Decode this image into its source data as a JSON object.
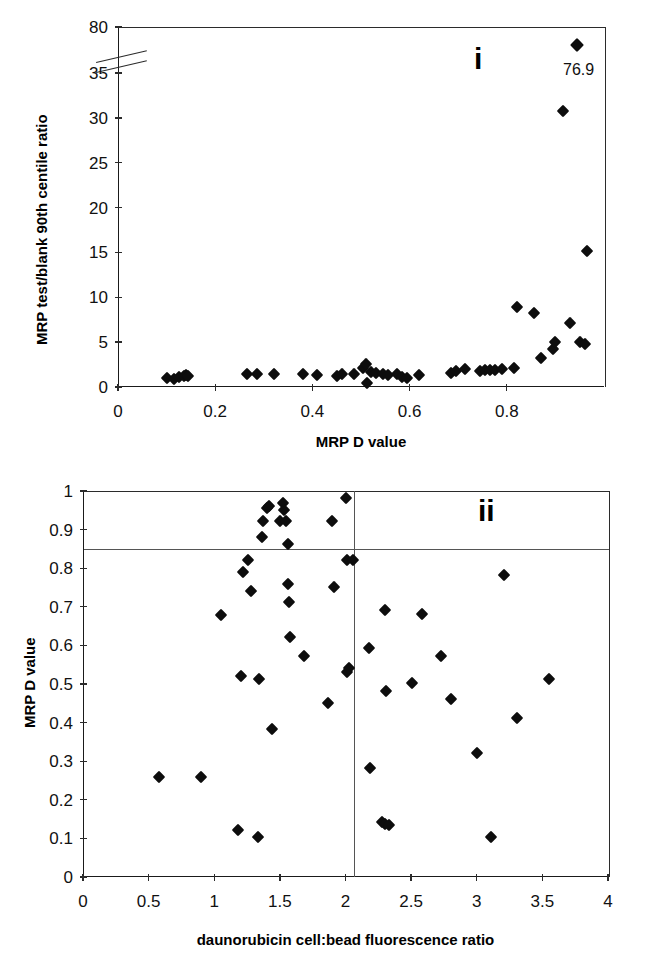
{
  "figure": {
    "background": "#ffffff",
    "marker_color": "#0d0d0d",
    "axis_color": "#2b2b2b",
    "refline_color": "#555555"
  },
  "chart_data": [
    {
      "type": "scatter",
      "panel_label": "i",
      "title": "",
      "xlabel": "MRP D value",
      "ylabel": "MRP test/blank 90th centile ratio",
      "xlim": [
        0,
        1.0
      ],
      "ylim": [
        0,
        40
      ],
      "grid": false,
      "legend": "none",
      "axis_break": {
        "present": true,
        "between": [
          36,
          79
        ],
        "note": "y-axis broken between 35 and 80"
      },
      "xticks": [
        0,
        0.2,
        0.4,
        0.6,
        0.8
      ],
      "xtick_labels": [
        "0",
        "0.2",
        "0.4",
        "0.6",
        "0.8"
      ],
      "yticks": [
        0,
        5,
        10,
        15,
        20,
        25,
        30,
        35,
        80
      ],
      "ytick_labels": [
        "0",
        "5",
        "10",
        "15",
        "20",
        "25",
        "30",
        "35",
        "80"
      ],
      "annotations": [
        {
          "text": "76.9",
          "x": 0.945,
          "y": 36.0,
          "note": "off-scale value label for topmost point"
        }
      ],
      "points": [
        {
          "x": 0.1,
          "y": 1.0
        },
        {
          "x": 0.115,
          "y": 0.9
        },
        {
          "x": 0.125,
          "y": 1.1
        },
        {
          "x": 0.135,
          "y": 1.2
        },
        {
          "x": 0.14,
          "y": 1.3
        },
        {
          "x": 0.145,
          "y": 1.2
        },
        {
          "x": 0.265,
          "y": 1.4
        },
        {
          "x": 0.285,
          "y": 1.4
        },
        {
          "x": 0.32,
          "y": 1.4
        },
        {
          "x": 0.38,
          "y": 1.5
        },
        {
          "x": 0.41,
          "y": 1.3
        },
        {
          "x": 0.45,
          "y": 1.2
        },
        {
          "x": 0.46,
          "y": 1.5
        },
        {
          "x": 0.485,
          "y": 1.4
        },
        {
          "x": 0.505,
          "y": 2.1
        },
        {
          "x": 0.51,
          "y": 2.6
        },
        {
          "x": 0.512,
          "y": 0.4
        },
        {
          "x": 0.52,
          "y": 1.7
        },
        {
          "x": 0.53,
          "y": 1.6
        },
        {
          "x": 0.545,
          "y": 1.4
        },
        {
          "x": 0.555,
          "y": 1.3
        },
        {
          "x": 0.575,
          "y": 1.4
        },
        {
          "x": 0.585,
          "y": 1.1
        },
        {
          "x": 0.595,
          "y": 1.0
        },
        {
          "x": 0.62,
          "y": 1.3
        },
        {
          "x": 0.685,
          "y": 1.6
        },
        {
          "x": 0.695,
          "y": 1.8
        },
        {
          "x": 0.715,
          "y": 2.0
        },
        {
          "x": 0.745,
          "y": 1.8
        },
        {
          "x": 0.755,
          "y": 1.9
        },
        {
          "x": 0.765,
          "y": 1.9
        },
        {
          "x": 0.775,
          "y": 1.9
        },
        {
          "x": 0.79,
          "y": 2.0
        },
        {
          "x": 0.815,
          "y": 2.1
        },
        {
          "x": 0.82,
          "y": 8.9
        },
        {
          "x": 0.855,
          "y": 8.3
        },
        {
          "x": 0.87,
          "y": 3.2
        },
        {
          "x": 0.895,
          "y": 4.2
        },
        {
          "x": 0.9,
          "y": 5.0
        },
        {
          "x": 0.915,
          "y": 30.8
        },
        {
          "x": 0.93,
          "y": 7.1
        },
        {
          "x": 0.945,
          "y": 76.9
        },
        {
          "x": 0.95,
          "y": 5.0
        },
        {
          "x": 0.96,
          "y": 4.8
        },
        {
          "x": 0.965,
          "y": 15.2
        }
      ]
    },
    {
      "type": "scatter",
      "panel_label": "ii",
      "title": "",
      "xlabel": "daunorubicin cell:bead fluorescence ratio",
      "ylabel": "MRP D value",
      "xlim": [
        0,
        4
      ],
      "ylim": [
        0,
        1
      ],
      "grid": false,
      "legend": "none",
      "xticks": [
        0,
        0.5,
        1,
        1.5,
        2,
        2.5,
        3,
        3.5,
        4
      ],
      "xtick_labels": [
        "0",
        "0.5",
        "1",
        "1.5",
        "2",
        "2.5",
        "3",
        "3.5",
        "4"
      ],
      "yticks": [
        0,
        0.1,
        0.2,
        0.3,
        0.4,
        0.5,
        0.6,
        0.7,
        0.8,
        0.9,
        1
      ],
      "ytick_labels": [
        "0",
        "0.1",
        "0.2",
        "0.3",
        "0.4",
        "0.5",
        "0.6",
        "0.7",
        "0.8",
        "0.9",
        "1"
      ],
      "reference_lines": [
        {
          "orientation": "horizontal",
          "value": 0.85
        },
        {
          "orientation": "vertical",
          "value": 2.06
        }
      ],
      "points": [
        {
          "x": 0.58,
          "y": 0.26
        },
        {
          "x": 0.9,
          "y": 0.26
        },
        {
          "x": 1.05,
          "y": 0.68
        },
        {
          "x": 1.18,
          "y": 0.122
        },
        {
          "x": 1.2,
          "y": 0.52
        },
        {
          "x": 1.22,
          "y": 0.79
        },
        {
          "x": 1.26,
          "y": 0.82
        },
        {
          "x": 1.28,
          "y": 0.74
        },
        {
          "x": 1.33,
          "y": 0.103
        },
        {
          "x": 1.34,
          "y": 0.512
        },
        {
          "x": 1.36,
          "y": 0.88
        },
        {
          "x": 1.37,
          "y": 0.922
        },
        {
          "x": 1.4,
          "y": 0.955
        },
        {
          "x": 1.42,
          "y": 0.96
        },
        {
          "x": 1.44,
          "y": 0.383
        },
        {
          "x": 1.5,
          "y": 0.922
        },
        {
          "x": 1.52,
          "y": 0.968
        },
        {
          "x": 1.53,
          "y": 0.952
        },
        {
          "x": 1.55,
          "y": 0.922
        },
        {
          "x": 1.56,
          "y": 0.862
        },
        {
          "x": 1.56,
          "y": 0.76
        },
        {
          "x": 1.57,
          "y": 0.712
        },
        {
          "x": 1.58,
          "y": 0.622
        },
        {
          "x": 1.68,
          "y": 0.572
        },
        {
          "x": 1.87,
          "y": 0.452
        },
        {
          "x": 1.9,
          "y": 0.922
        },
        {
          "x": 1.91,
          "y": 0.752
        },
        {
          "x": 2.0,
          "y": 0.982
        },
        {
          "x": 2.01,
          "y": 0.532
        },
        {
          "x": 2.03,
          "y": 0.542
        },
        {
          "x": 2.01,
          "y": 0.822
        },
        {
          "x": 2.06,
          "y": 0.822
        },
        {
          "x": 2.18,
          "y": 0.592
        },
        {
          "x": 2.19,
          "y": 0.282
        },
        {
          "x": 2.28,
          "y": 0.142
        },
        {
          "x": 2.3,
          "y": 0.138
        },
        {
          "x": 2.33,
          "y": 0.134
        },
        {
          "x": 2.3,
          "y": 0.692
        },
        {
          "x": 2.31,
          "y": 0.482
        },
        {
          "x": 2.51,
          "y": 0.502
        },
        {
          "x": 2.58,
          "y": 0.682
        },
        {
          "x": 2.73,
          "y": 0.572
        },
        {
          "x": 2.8,
          "y": 0.462
        },
        {
          "x": 3.0,
          "y": 0.322
        },
        {
          "x": 3.11,
          "y": 0.104
        },
        {
          "x": 3.21,
          "y": 0.782
        },
        {
          "x": 3.31,
          "y": 0.412
        },
        {
          "x": 3.55,
          "y": 0.512
        }
      ]
    }
  ]
}
